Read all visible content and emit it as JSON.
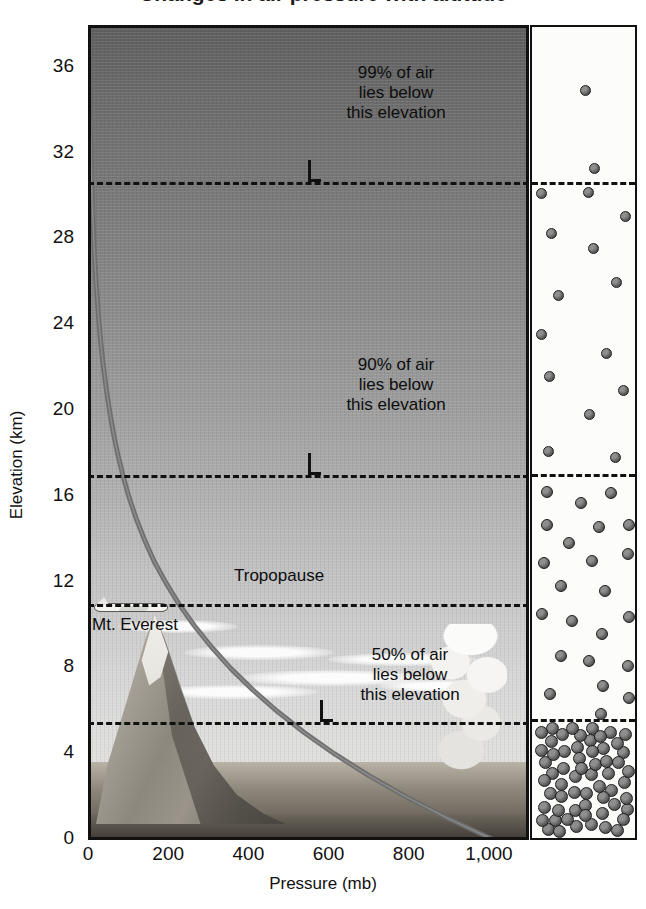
{
  "figure": {
    "title_partial": "Changes in air pressure with altitude",
    "y_axis": {
      "label": "Elevation (km)",
      "ticks": [
        "36",
        "32",
        "28",
        "24",
        "20",
        "16",
        "12",
        "8",
        "4",
        "0"
      ]
    },
    "x_axis": {
      "label": "Pressure (mb)",
      "ticks": [
        "0",
        "200",
        "400",
        "600",
        "800",
        "1,000"
      ]
    }
  },
  "annotations": {
    "a99": {
      "line1": "99% of air",
      "line2": "lies below",
      "line3": "this elevation"
    },
    "a90": {
      "line1": "90% of air",
      "line2": "lies below",
      "line3": "this elevation"
    },
    "a50": {
      "line1": "50% of air",
      "line2": "lies below",
      "line3": "this elevation"
    },
    "tropopause": "Tropopause",
    "everest": "Mt. Everest"
  },
  "chart_data": {
    "type": "line",
    "title": "Changes in air pressure with altitude",
    "xlabel": "Pressure (mb)",
    "ylabel": "Elevation (km)",
    "xlim": [
      0,
      1100
    ],
    "ylim": [
      0,
      38
    ],
    "xticks": [
      0,
      200,
      400,
      600,
      800,
      1000
    ],
    "xticklabels": [
      "0",
      "200",
      "400",
      "600",
      "800",
      "1,000"
    ],
    "yticks": [
      0,
      4,
      8,
      12,
      16,
      20,
      24,
      28,
      32,
      36
    ],
    "yticklabels": [
      "0",
      "4",
      "8",
      "12",
      "16",
      "20",
      "24",
      "28",
      "32",
      "36"
    ],
    "grid": false,
    "legend": null,
    "series": [
      {
        "name": "Air pressure",
        "color": "#6b6b6b",
        "x": [
          1013,
          899,
          795,
          701,
          616,
          540,
          472,
          411,
          356,
          308,
          265,
          227,
          194,
          165,
          141,
          120,
          102,
          87,
          74,
          63,
          54,
          46,
          39,
          33,
          28,
          24,
          20,
          17,
          14.5,
          12.3,
          10.4,
          8.8,
          7.5,
          6.4,
          5.4,
          4.6,
          3.9,
          3.3,
          2.8
        ],
        "y": [
          0,
          1,
          2,
          3,
          4,
          5,
          6,
          7,
          8,
          9,
          10,
          11,
          12,
          13,
          14,
          15,
          16,
          17,
          18,
          19,
          20,
          21,
          22,
          23,
          24,
          25,
          26,
          27,
          28,
          29,
          30,
          31,
          32,
          33,
          34,
          35,
          36,
          37,
          38
        ]
      }
    ],
    "reference_lines": [
      {
        "label": "99% of air lies below this elevation",
        "elevation_km": 30.7,
        "style": "dashed"
      },
      {
        "label": "90% of air lies below this elevation",
        "elevation_km": 17.0,
        "style": "dashed"
      },
      {
        "label": "Tropopause",
        "elevation_km": 11.0,
        "style": "dashed"
      },
      {
        "label": "50% of air lies below this elevation",
        "elevation_km": 5.5,
        "style": "dashed"
      }
    ],
    "features": [
      {
        "label": "Mt. Everest",
        "elevation_km": 8.8
      },
      {
        "label": "airplane",
        "elevation_km": 11.0
      },
      {
        "label": "cumulonimbus cloud",
        "elevation_km": 0.5
      }
    ],
    "side_panel": {
      "description": "Air molecule density, increasing toward the surface",
      "bands": [
        {
          "elevation_km_range": [
            30.7,
            38
          ],
          "relative_density": 0.03
        },
        {
          "elevation_km_range": [
            17.0,
            30.7
          ],
          "relative_density": 0.18
        },
        {
          "elevation_km_range": [
            5.5,
            17.0
          ],
          "relative_density": 0.45
        },
        {
          "elevation_km_range": [
            0,
            5.5
          ],
          "relative_density": 1.0
        }
      ]
    }
  },
  "colors": {
    "axis": "#111111",
    "curve": "#6b6b6b",
    "dashed_line": "#111111",
    "panel_background": "#fcfcfb",
    "molecule": "#5f5f5f"
  }
}
